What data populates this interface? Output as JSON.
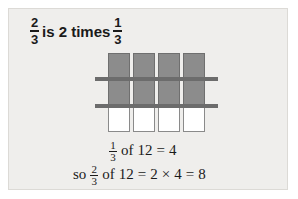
{
  "figure": {
    "headline": {
      "fraction_left": {
        "numerator": "2",
        "denominator": "3"
      },
      "text_middle": "is 2 times",
      "fraction_right": {
        "numerator": "1",
        "denominator": "3"
      }
    },
    "diagram": {
      "description": "grid-of-twelve-squares",
      "columns": 4,
      "rows": 3,
      "shaded_count": 8,
      "unshaded_count": 4,
      "total_count": 12,
      "shaded_color": "#8c8c8c",
      "unshaded_color": "#ffffff",
      "rule_color": "#6c6c6c",
      "cells": [
        "shaded",
        "shaded",
        "shaded",
        "shaded",
        "shaded",
        "shaded",
        "shaded",
        "shaded",
        "unshaded",
        "unshaded",
        "unshaded",
        "unshaded"
      ],
      "rules": [
        {
          "name": "upper-divider"
        },
        {
          "name": "lower-divider"
        }
      ]
    },
    "equations": [
      {
        "name": "unit-fraction-equation",
        "tokens": [
          "of",
          "12",
          "=",
          "4"
        ],
        "fraction": {
          "numerator": "1",
          "denominator": "3"
        }
      },
      {
        "name": "scaled-fraction-equation",
        "prefix": "so",
        "tokens": [
          "of",
          "12",
          "=",
          "2",
          "×",
          "4",
          "=",
          "8"
        ],
        "fraction": {
          "numerator": "2",
          "denominator": "3"
        }
      }
    ]
  }
}
